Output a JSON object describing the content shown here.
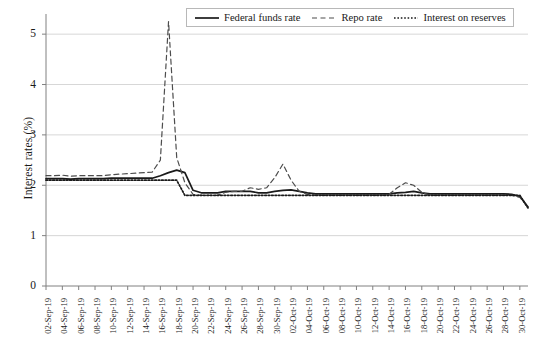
{
  "chart_data": {
    "type": "line",
    "title": "",
    "xlabel": "",
    "ylabel": "Interest rates (%)",
    "ylim": [
      0,
      5.4
    ],
    "yticks": [
      0,
      1,
      2,
      3,
      4,
      5
    ],
    "grid": true,
    "legend_position": "top-center",
    "x": [
      "02-Sep-19",
      "03-Sep-19",
      "04-Sep-19",
      "05-Sep-19",
      "06-Sep-19",
      "07-Sep-19",
      "08-Sep-19",
      "09-Sep-19",
      "10-Sep-19",
      "11-Sep-19",
      "12-Sep-19",
      "13-Sep-19",
      "14-Sep-19",
      "15-Sep-19",
      "16-Sep-19",
      "17-Sep-19",
      "18-Sep-19",
      "19-Sep-19",
      "20-Sep-19",
      "21-Sep-19",
      "22-Sep-19",
      "23-Sep-19",
      "24-Sep-19",
      "25-Sep-19",
      "26-Sep-19",
      "27-Sep-19",
      "28-Sep-19",
      "29-Sep-19",
      "30-Sep-19",
      "01-Oct-19",
      "02-Oct-19",
      "03-Oct-19",
      "04-Oct-19",
      "05-Oct-19",
      "06-Oct-19",
      "07-Oct-19",
      "08-Oct-19",
      "09-Oct-19",
      "10-Oct-19",
      "11-Oct-19",
      "12-Oct-19",
      "13-Oct-19",
      "14-Oct-19",
      "15-Oct-19",
      "16-Oct-19",
      "17-Oct-19",
      "18-Oct-19",
      "19-Oct-19",
      "20-Oct-19",
      "21-Oct-19",
      "22-Oct-19",
      "23-Oct-19",
      "24-Oct-19",
      "25-Oct-19",
      "26-Oct-19",
      "27-Oct-19",
      "28-Oct-19",
      "29-Oct-19",
      "30-Oct-19",
      "31-Oct-19"
    ],
    "xtick_labels": [
      "02-Sep-19",
      "04-Sep-19",
      "06-Sep-19",
      "08-Sep-19",
      "10-Sep-19",
      "12-Sep-19",
      "14-Sep-19",
      "16-Sep-19",
      "18-Sep-19",
      "20-Sep-19",
      "22-Sep-19",
      "24-Sep-19",
      "26-Sep-19",
      "28-Sep-19",
      "30-Sep-19",
      "02-Oct-19",
      "04-Oct-19",
      "06-Oct-19",
      "08-Oct-19",
      "10-Oct-19",
      "12-Oct-19",
      "14-Oct-19",
      "16-Oct-19",
      "18-Oct-19",
      "20-Oct-19",
      "22-Oct-19",
      "24-Oct-19",
      "26-Oct-19",
      "28-Oct-19",
      "30-Oct-19"
    ],
    "series": [
      {
        "name": "Federal funds rate",
        "style": "solid",
        "color": "#1a1a1a",
        "values": [
          2.13,
          2.13,
          2.13,
          2.12,
          2.13,
          2.13,
          2.13,
          2.13,
          2.14,
          2.14,
          2.14,
          2.14,
          2.14,
          2.14,
          2.19,
          2.25,
          2.3,
          2.25,
          1.9,
          1.85,
          1.85,
          1.85,
          1.88,
          1.88,
          1.88,
          1.88,
          1.85,
          1.85,
          1.88,
          1.9,
          1.91,
          1.88,
          1.85,
          1.83,
          1.83,
          1.83,
          1.83,
          1.83,
          1.83,
          1.83,
          1.83,
          1.83,
          1.83,
          1.85,
          1.86,
          1.88,
          1.85,
          1.83,
          1.83,
          1.83,
          1.83,
          1.83,
          1.83,
          1.83,
          1.83,
          1.83,
          1.83,
          1.82,
          1.78,
          1.57
        ]
      },
      {
        "name": "Repo rate",
        "style": "dashed",
        "color": "#4d4d4d",
        "values": [
          2.19,
          2.19,
          2.2,
          2.18,
          2.19,
          2.19,
          2.19,
          2.19,
          2.21,
          2.22,
          2.23,
          2.24,
          2.25,
          2.26,
          2.5,
          5.25,
          2.55,
          2.05,
          1.82,
          1.8,
          1.8,
          1.8,
          1.86,
          1.88,
          1.88,
          1.95,
          1.92,
          1.95,
          2.15,
          2.42,
          2.1,
          1.88,
          1.82,
          1.8,
          1.8,
          1.8,
          1.8,
          1.8,
          1.8,
          1.8,
          1.8,
          1.8,
          1.82,
          1.95,
          2.05,
          2.0,
          1.86,
          1.8,
          1.8,
          1.8,
          1.8,
          1.8,
          1.8,
          1.8,
          1.8,
          1.8,
          1.8,
          1.8,
          1.76,
          1.56
        ]
      },
      {
        "name": "Interest on reserves",
        "style": "dotted",
        "color": "#1a1a1a",
        "values": [
          2.1,
          2.1,
          2.1,
          2.1,
          2.1,
          2.1,
          2.1,
          2.1,
          2.1,
          2.1,
          2.1,
          2.1,
          2.1,
          2.1,
          2.1,
          2.1,
          2.1,
          1.8,
          1.8,
          1.8,
          1.8,
          1.8,
          1.8,
          1.8,
          1.8,
          1.8,
          1.8,
          1.8,
          1.8,
          1.8,
          1.8,
          1.8,
          1.8,
          1.8,
          1.8,
          1.8,
          1.8,
          1.8,
          1.8,
          1.8,
          1.8,
          1.8,
          1.8,
          1.8,
          1.8,
          1.8,
          1.8,
          1.8,
          1.8,
          1.8,
          1.8,
          1.8,
          1.8,
          1.8,
          1.8,
          1.8,
          1.8,
          1.8,
          1.8,
          1.55
        ]
      }
    ]
  },
  "legend": {
    "items": [
      {
        "label": "Federal funds rate"
      },
      {
        "label": "Repo rate"
      },
      {
        "label": "Interest on reserves"
      }
    ]
  },
  "axis": {
    "y_title": "Interest rates (%)"
  }
}
